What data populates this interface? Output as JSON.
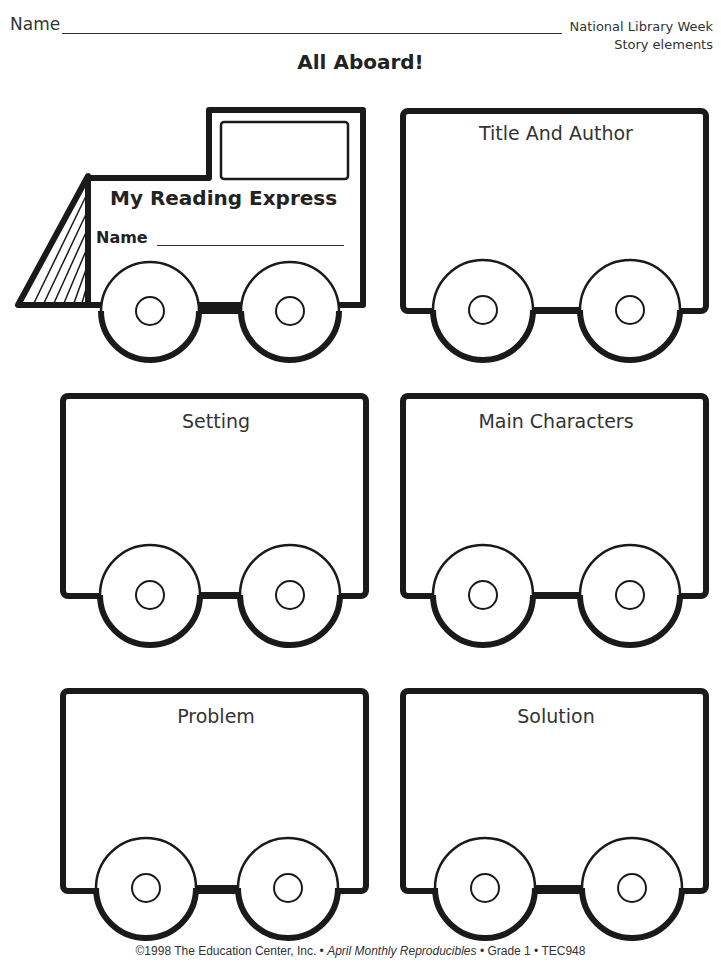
{
  "header": {
    "name_label": "Name",
    "subject_line1": "National Library Week",
    "subject_line2": "Story elements",
    "title": "All Aboard!"
  },
  "engine": {
    "title": "My Reading Express",
    "name_label": "Name"
  },
  "cars": [
    {
      "label": "Title And Author"
    },
    {
      "label": "Setting"
    },
    {
      "label": "Main Characters"
    },
    {
      "label": "Problem"
    },
    {
      "label": "Solution"
    }
  ],
  "footer": {
    "copyright": "©1998 The Education Center, Inc. •",
    "publication": "April Monthly Reproducibles",
    "grade": "• Grade 1 • TEC948"
  },
  "colors": {
    "ink": "#1a1a1a",
    "paper": "#ffffff"
  }
}
